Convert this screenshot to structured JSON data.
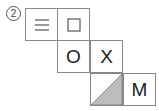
{
  "label": "2",
  "cells": [
    {
      "id": "lines",
      "symbol": "三"
    },
    {
      "id": "square",
      "symbol": "□"
    },
    {
      "id": "o",
      "symbol": "O"
    },
    {
      "id": "x",
      "symbol": "X"
    },
    {
      "id": "triangle",
      "symbol": "",
      "fill": "#bdbdbd"
    },
    {
      "id": "m",
      "symbol": "M"
    }
  ]
}
